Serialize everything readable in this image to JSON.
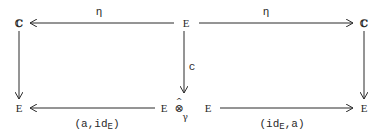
{
  "diagram": {
    "type": "commutative-diagram",
    "nodes": {
      "top_left": "ℂ",
      "top_center": "E",
      "top_right": "ℂ",
      "bottom_left": "E",
      "bottom_center_left": "E",
      "bottom_center_right": "E",
      "bottom_right": "E"
    },
    "operator": {
      "hat": "^",
      "symbol": "⊗",
      "subscript": "γ"
    },
    "edges": {
      "top_left_arrow": {
        "label": "η",
        "from": "E",
        "to": "ℂ"
      },
      "top_right_arrow": {
        "label": "η",
        "from": "E",
        "to": "ℂ"
      },
      "center_down_arrow": {
        "label": "c",
        "from": "E",
        "to": "E ⊗γ E"
      },
      "left_down_arrow": {
        "label": "",
        "from": "ℂ",
        "to": "E"
      },
      "right_down_arrow": {
        "label": "",
        "from": "ℂ",
        "to": "E"
      },
      "bottom_left_arrow": {
        "label_main": "(a,id",
        "label_sub": "E",
        "label_end": ")"
      },
      "bottom_right_arrow": {
        "label_main": "(id",
        "label_sub": "E",
        "label_end": ",a)"
      }
    },
    "colors": {
      "ink": "#2a2a2a",
      "background": "#ffffff"
    }
  }
}
